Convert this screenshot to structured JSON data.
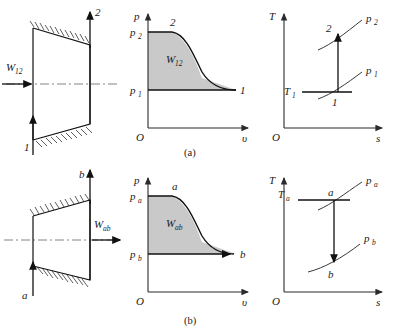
{
  "figure": {
    "title_a": "(a)",
    "title_b": "(b)"
  },
  "case_a": {
    "device": {
      "work_label": "W",
      "work_sub": "12",
      "inlet_label": "1",
      "outlet_label": "2",
      "type": "converging-duct-compressor",
      "work_direction": "into-device"
    },
    "pv_chart": {
      "y_axis_label": "p",
      "x_axis_label": "υ",
      "origin_label": "O",
      "p_high_label": "p",
      "p_high_sub": "2",
      "p_low_label": "p",
      "p_low_sub": "1",
      "state_start_label": "1",
      "state_end_label": "2",
      "area_label": "W",
      "area_sub": "12",
      "area_fill": "#c9c9c9"
    },
    "ts_chart": {
      "y_axis_label": "T",
      "x_axis_label": "s",
      "origin_label": "O",
      "isobar_high_label": "p",
      "isobar_high_sub": "2",
      "isobar_low_label": "p",
      "isobar_low_sub": "1",
      "temp_label": "T",
      "temp_sub": "1",
      "state_start_label": "1",
      "state_end_label": "2",
      "process_arrow_direction": "up"
    }
  },
  "case_b": {
    "device": {
      "work_label": "W",
      "work_sub": "ab",
      "inlet_label": "a",
      "outlet_label": "b",
      "type": "diverging-duct-turbine",
      "work_direction": "out-of-device"
    },
    "pv_chart": {
      "y_axis_label": "p",
      "x_axis_label": "υ",
      "origin_label": "O",
      "p_high_label": "p",
      "p_high_sub": "a",
      "p_low_label": "p",
      "p_low_sub": "b",
      "state_start_label": "a",
      "state_end_label": "b",
      "area_label": "W",
      "area_sub": "ab",
      "area_fill": "#c9c9c9"
    },
    "ts_chart": {
      "y_axis_label": "T",
      "x_axis_label": "s",
      "origin_label": "O",
      "isobar_high_label": "p",
      "isobar_high_sub": "a",
      "isobar_low_label": "p",
      "isobar_low_sub": "b",
      "temp_label": "T",
      "temp_sub": "a",
      "state_start_label": "a",
      "state_end_label": "b",
      "process_arrow_direction": "down"
    }
  }
}
